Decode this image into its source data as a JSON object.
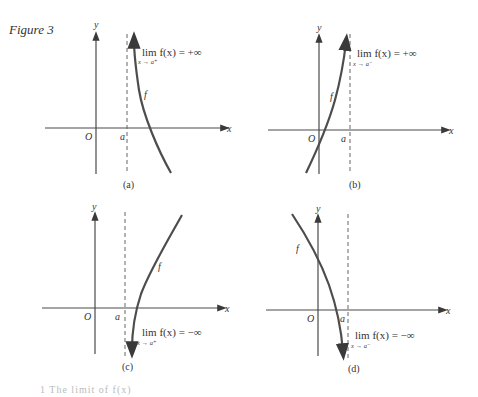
{
  "figure": {
    "title": "Figure 3",
    "panels": [
      {
        "id": "a",
        "caption": "(a)",
        "curve_label": "f",
        "limit_expr": "lim  f(x) = +∞",
        "limit_sub": "x → a⁺",
        "origin": "O",
        "asymptote": "a",
        "x_axis": "x",
        "y_axis": "y"
      },
      {
        "id": "b",
        "caption": "(b)",
        "curve_label": "f",
        "limit_expr": "lim  f(x) = +∞",
        "limit_sub": "x → a⁻",
        "origin": "O",
        "asymptote": "a",
        "x_axis": "x",
        "y_axis": "y"
      },
      {
        "id": "c",
        "caption": "(c)",
        "curve_label": "f",
        "limit_expr": "lim  f(x) = −∞",
        "limit_sub": "x → a⁺",
        "origin": "O",
        "asymptote": "a",
        "x_axis": "x",
        "y_axis": "y"
      },
      {
        "id": "d",
        "caption": "(d)",
        "curve_label": "f",
        "limit_expr": "lim  f(x) = −∞",
        "limit_sub": "x → a⁻",
        "origin": "O",
        "asymptote": "a",
        "x_axis": "x",
        "y_axis": "y"
      }
    ]
  },
  "footer_text": "1  The limit of f(x)"
}
